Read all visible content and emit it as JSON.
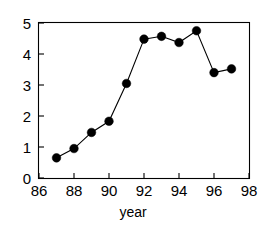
{
  "chart_data": {
    "type": "line",
    "title": "",
    "subtitle": "",
    "xlabel": "year",
    "ylabel": "",
    "x": [
      87,
      88,
      89,
      90,
      91,
      92,
      93,
      94,
      95,
      96,
      97
    ],
    "values": [
      0.65,
      0.95,
      1.47,
      1.83,
      3.05,
      4.48,
      4.57,
      4.37,
      4.75,
      3.4,
      3.52
    ],
    "series": [
      {
        "name": "series-1",
        "x": [
          87,
          88,
          89,
          90,
          91,
          92,
          93,
          94,
          95,
          96,
          97
        ],
        "values": [
          0.65,
          0.95,
          1.47,
          1.83,
          3.05,
          4.48,
          4.57,
          4.37,
          4.75,
          3.4,
          3.52
        ]
      }
    ],
    "xlim": [
      86,
      98
    ],
    "ylim": [
      0,
      5
    ],
    "xticks": [
      86,
      88,
      90,
      92,
      94,
      96,
      98
    ],
    "xticklabels": [
      "86",
      "88",
      "90",
      "92",
      "94",
      "96",
      "98"
    ],
    "yticks": [
      0,
      1,
      2,
      3,
      4,
      5
    ],
    "yticklabels": [
      "0",
      "1",
      "2",
      "3",
      "4",
      "5"
    ],
    "grid": false,
    "legend": null,
    "legend_position": "none",
    "marker": "filled-circle",
    "marker_color": "#000000",
    "line_color": "#000000",
    "background_color": "#ffffff",
    "annotations": []
  },
  "axes": {
    "x_title": "year",
    "y_title": ""
  }
}
